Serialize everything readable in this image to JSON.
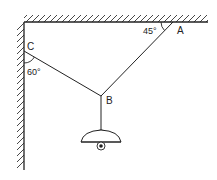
{
  "diagram": {
    "type": "statics-lamp-suspension",
    "points": {
      "A": {
        "label": "A"
      },
      "B": {
        "label": "B"
      },
      "C": {
        "label": "C"
      }
    },
    "angles": {
      "at_A": "45°",
      "at_C": "60°"
    },
    "elements": [
      "ceiling",
      "wall",
      "string-AB",
      "string-CB",
      "string-B-lamp",
      "lamp"
    ],
    "colors": {
      "line": "#222222",
      "background": "#ffffff"
    }
  }
}
